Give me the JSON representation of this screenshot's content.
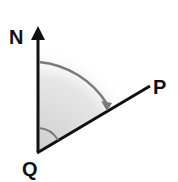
{
  "diagram": {
    "labels": {
      "north": "N",
      "point_p": "P",
      "point_q": "Q"
    },
    "colors": {
      "line": "#111111",
      "arc": "#7a7a7a",
      "shade": "#d9d9d9"
    }
  }
}
